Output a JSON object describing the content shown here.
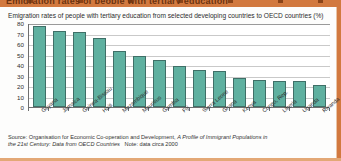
{
  "figure": {
    "clipped_heading": "Emigration rates of people with tertiary education",
    "title": "Emigration rates of people with tertiary education from selected developing countries to OECD countries (%)",
    "source_line_1": "Source: Organisation for Economic Co-operation and Development, ",
    "source_italic_1": "A Profile of Immigrant Populations in",
    "source_italic_2": "the 21st Century: Data from OECD Countries",
    "source_note": "Note: data circa 2000",
    "accent_color": "#d2793f",
    "bar_color": "#5fb0a0",
    "bar_border_color": "#3f6f67",
    "grid_color": "#c9c9c9"
  },
  "chart_data": {
    "type": "bar",
    "title": "Emigration rates of people with tertiary education from selected developing countries to OECD countries (%)",
    "xlabel": "",
    "ylabel": "",
    "ylim": [
      0,
      80
    ],
    "yticks": [
      0,
      10,
      20,
      30,
      40,
      50,
      60,
      70,
      80
    ],
    "grid": true,
    "legend": "none",
    "categories": [
      "Guyana",
      "Jamaica",
      "Guinea-Bissau",
      "Haiti",
      "Mozambique",
      "Mauritius",
      "Gambia",
      "Fiji",
      "Sierra Leone",
      "Ghana",
      "Kenya",
      "Congo, Rep.",
      "Liberia",
      "Uganda",
      "Rwanda"
    ],
    "values": [
      77,
      72,
      71,
      66,
      53,
      49,
      45,
      39,
      35,
      34,
      28,
      26,
      25,
      25,
      21
    ]
  }
}
